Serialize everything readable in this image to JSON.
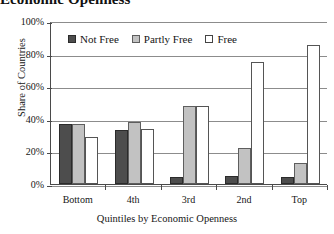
{
  "title": "Economic Openness",
  "legend": {
    "position": "top-center-inside",
    "items": [
      {
        "label": "Not Free",
        "color": "#4d4d4d"
      },
      {
        "label": "Partly Free",
        "color": "#c2c2c2"
      },
      {
        "label": "Free",
        "color": "#ffffff"
      }
    ]
  },
  "axes": {
    "y_title": "Share of Countries",
    "x_title": "Quintiles by Economic Openness",
    "y_ticks": [
      "0%",
      "20%",
      "40%",
      "60%",
      "80%",
      "100%"
    ]
  },
  "chart_data": {
    "type": "bar",
    "title": "Economic Openness",
    "xlabel": "Quintiles by Economic Openness",
    "ylabel": "Share of Countries",
    "categories": [
      "Bottom",
      "4th",
      "3rd",
      "2nd",
      "Top"
    ],
    "series": [
      {
        "name": "Not Free",
        "color": "#4d4d4d",
        "values": [
          37,
          33,
          4,
          5,
          4
        ]
      },
      {
        "name": "Partly Free",
        "color": "#c2c2c2",
        "values": [
          37,
          38,
          48,
          22,
          13
        ]
      },
      {
        "name": "Free",
        "color": "#ffffff",
        "values": [
          29,
          34,
          48,
          75,
          85
        ]
      }
    ],
    "ylim": [
      0,
      100
    ],
    "ytick_values": [
      0,
      20,
      40,
      60,
      80,
      100
    ],
    "ytick_labels": [
      "0%",
      "20%",
      "40%",
      "60%",
      "80%",
      "100%"
    ],
    "grid": "horizontal",
    "legend_position": "inside top center",
    "bar_group_mode": "grouped"
  }
}
